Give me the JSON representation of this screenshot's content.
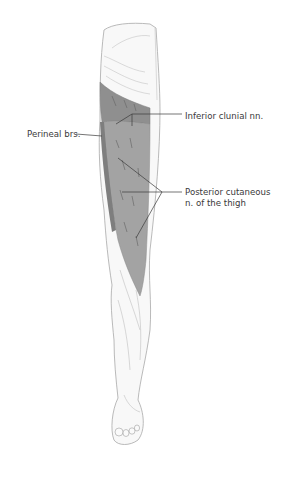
{
  "diagram": {
    "colors": {
      "skin_outline": "#9a9a9a",
      "skin_fill": "#f7f7f7",
      "territory_dark": "#8c8c8c",
      "territory_light": "#a6a6a6",
      "leader_line": "#3a3a3a",
      "label_text": "#3a3a3a"
    },
    "labels": {
      "perineal": "Perineal brs.",
      "inferior_clunial": "Inferior  clunial nn.",
      "posterior_cutaneous_line1": "Posterior cutaneous",
      "posterior_cutaneous_line2": "n. of the thigh"
    }
  }
}
